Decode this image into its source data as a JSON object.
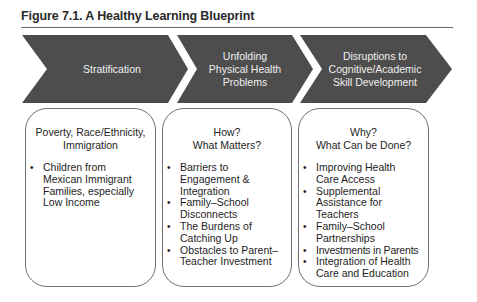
{
  "figure": {
    "title": "Figure 7.1. A Healthy Learning Blueprint"
  },
  "colors": {
    "chevron_fill": "#4d4d4d",
    "chevron_text": "#f0f0f0",
    "box_border": "#6f6f6f",
    "text": "#1e1e1e"
  },
  "stages": [
    {
      "label": "Stratification",
      "box": {
        "heading_lines": [
          "Poverty, Race/Ethnicity,",
          "Immigration"
        ],
        "items": [
          "Children from Mexican Immigrant Families, especially Low Income"
        ]
      }
    },
    {
      "label_lines": [
        "Unfolding",
        "Physical Health",
        "Problems"
      ],
      "box": {
        "heading_lines": [
          "How?",
          "What Matters?"
        ],
        "items": [
          "Barriers to Engagement & Integration",
          "Family–School Disconnects",
          "The Burdens of Catching Up",
          "Obstacles to Parent–Teacher Investment"
        ]
      }
    },
    {
      "label_lines": [
        "Disruptions to",
        "Cognitive/Academic",
        "Skill Development"
      ],
      "box": {
        "heading_lines": [
          "Why?",
          "What Can be Done?"
        ],
        "items": [
          "Improving Health Care Access",
          "Supplemental Assistance for Teachers",
          "Family–School Partnerships",
          "Investments in Parents",
          "Integration of Health Care and Education"
        ]
      }
    }
  ]
}
